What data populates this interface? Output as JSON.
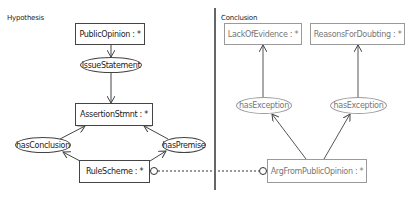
{
  "panels": {
    "hypothesis": {
      "label": "Hypothesis",
      "nodes": {
        "public_opinion": "PublicOpinion : *",
        "issue_statement": "IssueStatement",
        "assertion_stmnt": "AssertionStmnt : *",
        "has_conclusion": "hasConclusion",
        "has_premise": "hasPremise",
        "rule_scheme": "RuleScheme : *"
      }
    },
    "conclusion": {
      "label": "Conclusion",
      "nodes": {
        "lack_of_evidence": "LackOfEvidence : *",
        "reasons_for_doubting": "ReasonsForDoubting : *",
        "has_exception_left": "hasException",
        "has_exception_right": "hasException",
        "arg_from_public_opinion": "ArgFromPublicOpinion : *"
      }
    }
  },
  "colors": {
    "edge": "#444444",
    "faded_edge": "#555555",
    "divider": "#666666"
  }
}
